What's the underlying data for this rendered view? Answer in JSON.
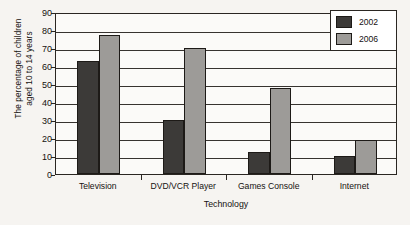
{
  "chart_data": {
    "type": "bar",
    "title": "",
    "xlabel": "Technology",
    "ylabel_lines": [
      "The percentage of children",
      "aged 10 to 14 years"
    ],
    "categories": [
      "Television",
      "DVD/VCR Player",
      "Games Console",
      "Internet"
    ],
    "series": [
      {
        "name": "2002",
        "color": "#3c3a38",
        "values": [
          63,
          30,
          12,
          10
        ]
      },
      {
        "name": "2006",
        "color": "#9d9b98",
        "values": [
          77,
          70,
          48,
          19
        ]
      }
    ],
    "ylim": [
      0,
      90
    ],
    "yticks": [
      0,
      10,
      20,
      30,
      40,
      50,
      60,
      70,
      80,
      90
    ],
    "ytick_labels": [
      "0",
      "10",
      "20",
      "30",
      "40",
      "50",
      "60",
      "70",
      "80",
      "90"
    ],
    "grid": true,
    "legend_position": "top-right"
  }
}
